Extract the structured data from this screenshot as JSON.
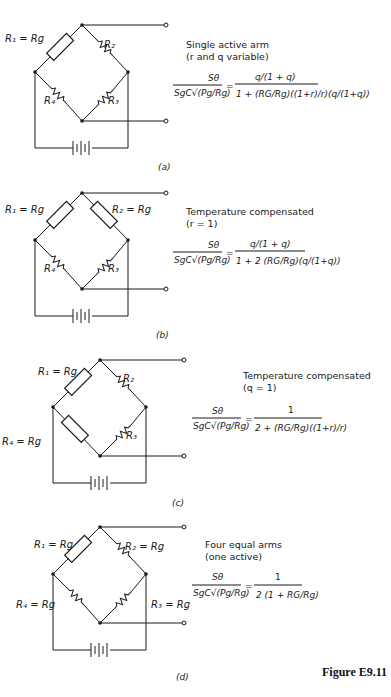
{
  "figure": {
    "label": "Figure E9.11",
    "panels": [
      {
        "caption": "(a)",
        "title_line1": "Single active arm",
        "title_line2": "(r and q variable)",
        "labels": {
          "r1": "R₁ = Rg",
          "r2": "R₂",
          "r3": "R₃",
          "r4": "R₄"
        },
        "equation": {
          "lhs_num": "Sθ",
          "lhs_den": "SgC√(Pg/Rg)",
          "rhs_num": "q/(1 + q)",
          "rhs_den": "1 + (RG/Rg)((1+r)/r)(q/(1+q))"
        }
      },
      {
        "caption": "(b)",
        "title_line1": "Temperature compensated",
        "title_line2": "(r = 1)",
        "labels": {
          "r1": "R₁ = Rg",
          "r2": "R₂ = Rg",
          "r3": "R₃",
          "r4": "R₄"
        },
        "equation": {
          "lhs_num": "Sθ",
          "lhs_den": "SgC√(Pg/Rg)",
          "rhs_num": "q/(1 + q)",
          "rhs_den": "1 + 2 (RG/Rg)(q/(1+q))"
        }
      },
      {
        "caption": "(c)",
        "title_line1": "Temperature compensated",
        "title_line2": "(q = 1)",
        "labels": {
          "r1": "R₁ = Rg",
          "r2": "R₂",
          "r3": "R₃",
          "r4": "R₄ = Rg"
        },
        "equation": {
          "lhs_num": "Sθ",
          "lhs_den": "SgC√(Pg/Rg)",
          "rhs_num": "1",
          "rhs_den": "2 + (RG/Rg)((1+r)/r)"
        }
      },
      {
        "caption": "(d)",
        "title_line1": "Four equal arms",
        "title_line2": "(one active)",
        "labels": {
          "r1": "R₁ = Rg",
          "r2": "R₂ = Rg",
          "r3": "R₃ = Rg",
          "r4": "R₄ = Rg"
        },
        "equation": {
          "lhs_num": "Sθ",
          "lhs_den": "SgC√(Pg/Rg)",
          "rhs_num": "1",
          "rhs_den": "2 (1 + RG/Rg)"
        }
      }
    ]
  }
}
